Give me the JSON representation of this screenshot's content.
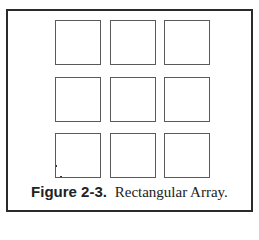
{
  "figure": {
    "label": "Figure 2-3.",
    "title": "Rectangular Array.",
    "grid": {
      "rows": 3,
      "cols": 3
    }
  },
  "colors": {
    "frame": "#2a2a2a",
    "square_border": "#5a5a5a",
    "background": "#ffffff"
  }
}
